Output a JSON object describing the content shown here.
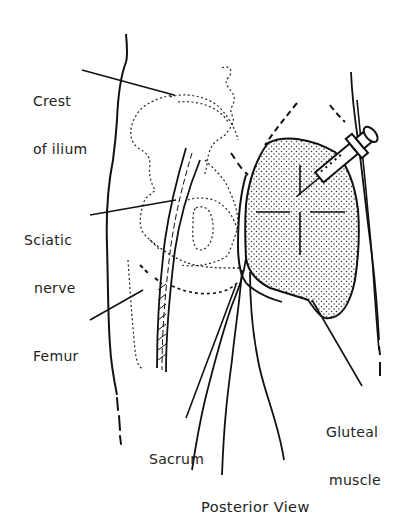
{
  "diagram": {
    "caption": "Posterior View",
    "labels": {
      "crest_line1": "Crest",
      "crest_line2": "of ilium",
      "sciatic_line1": "Sciatic",
      "sciatic_line2": "nerve",
      "femur": "Femur",
      "sacrum": "Sacrum",
      "gluteal_line1": "Gluteal",
      "gluteal_line2": "muscle"
    },
    "colors": {
      "ink": "#111111",
      "paper": "#ffffff"
    }
  }
}
